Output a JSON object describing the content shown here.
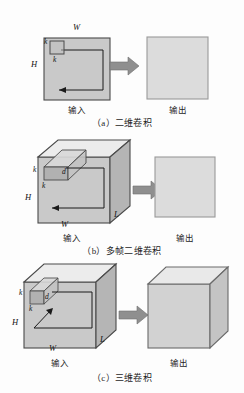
{
  "figure": {
    "title_alt": "卷积类型对比示意图",
    "background_color": "#fdfdfd",
    "stroke_color": "#3a3a3a"
  },
  "colors": {
    "input_fill": "#c9c9c9",
    "input_top_fill": "#ececec",
    "input_side_fill": "#b5b5b5",
    "output_fill": "#dcdcdc",
    "output_top_fill": "#e9e9e9",
    "output_side_fill": "#c4c4c4",
    "kernel_fill": "#b0b0b0",
    "kernel_top_fill": "#d8d8d8",
    "arrow_fill": "#8f8f8f",
    "outline": "#4a4a4a",
    "path_line": "#1a1a1a"
  },
  "panels": [
    {
      "id": "a",
      "caption": "（a）二维卷积",
      "input_label": "输入",
      "output_label": "输出",
      "input_shape": "square",
      "output_shape": "square",
      "kernel_shape": "square",
      "dims": [
        {
          "name": "W",
          "text": "W"
        },
        {
          "name": "H",
          "text": "H"
        },
        {
          "name": "k-vertical",
          "text": "k"
        },
        {
          "name": "k-horizontal",
          "text": "k"
        }
      ],
      "scan_path": "2d-raster"
    },
    {
      "id": "b",
      "caption": "（b）多帧二维卷积",
      "input_label": "输入",
      "output_label": "输出",
      "input_shape": "cuboid",
      "output_shape": "square",
      "kernel_shape": "depth-tube",
      "dims": [
        {
          "name": "k-vertical",
          "text": "k"
        },
        {
          "name": "k-horizontal",
          "text": "k"
        },
        {
          "name": "d-depth",
          "text": "d"
        },
        {
          "name": "H",
          "text": "H"
        },
        {
          "name": "W",
          "text": "W"
        },
        {
          "name": "L",
          "text": "L"
        }
      ],
      "scan_path": "2d-raster"
    },
    {
      "id": "c",
      "caption": "（c）三维卷积",
      "input_label": "输入",
      "output_label": "输出",
      "input_shape": "cuboid",
      "output_shape": "cuboid",
      "kernel_shape": "small-cube",
      "dims": [
        {
          "name": "k-vertical",
          "text": "k"
        },
        {
          "name": "k-horizontal",
          "text": "k"
        },
        {
          "name": "d-depth",
          "text": "d"
        },
        {
          "name": "H",
          "text": "H"
        },
        {
          "name": "W",
          "text": "W"
        },
        {
          "name": "L",
          "text": "L"
        }
      ],
      "scan_path": "3d-diagonal"
    }
  ]
}
